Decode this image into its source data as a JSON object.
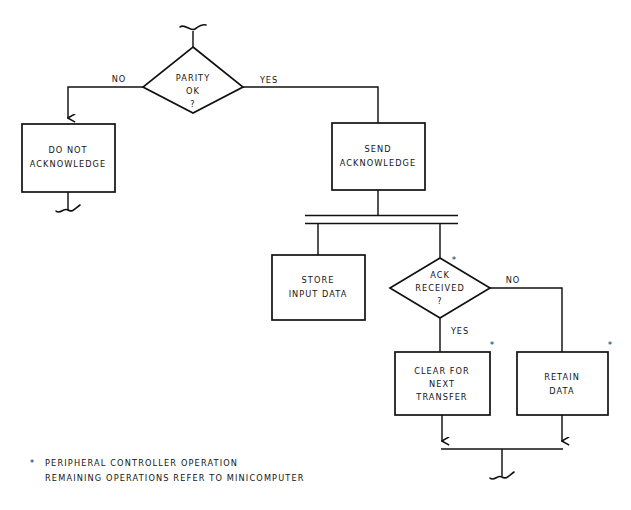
{
  "diagram": {
    "title_fragment_top": "",
    "nodes": {
      "parity": {
        "line1": "PARITY",
        "line2": "OK",
        "line3": "?"
      },
      "do_not_ack": {
        "line1": "DO NOT",
        "line2": "ACKNOWLEDGE"
      },
      "send_ack": {
        "line1": "SEND",
        "line2": "ACKNOWLEDGE"
      },
      "store_input": {
        "line1": "STORE",
        "line2": "INPUT DATA"
      },
      "ack_received": {
        "line1": "ACK",
        "line2": "RECEIVED",
        "line3": "?"
      },
      "clear_transfer": {
        "line1": "CLEAR FOR",
        "line2": "NEXT",
        "line3": "TRANSFER"
      },
      "retain_data": {
        "line1": "RETAIN",
        "line2": "DATA"
      }
    },
    "edge_labels": {
      "parity_no": "NO",
      "parity_yes": "YES",
      "ack_no": "NO",
      "ack_yes": "YES"
    },
    "markers": {
      "asterisk": "*"
    },
    "footnote": {
      "symbol": "*",
      "line1": "PERIPHERAL CONTROLLER OPERATION",
      "line2": "REMAINING OPERATIONS REFER TO MINICOMPUTER"
    },
    "colors": {
      "ink": "#111111",
      "paper": "#ffffff"
    }
  }
}
